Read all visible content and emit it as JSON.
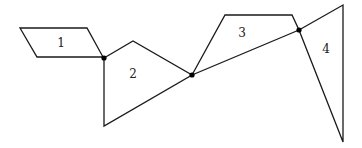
{
  "diagram": {
    "regions": [
      {
        "label": "1",
        "points": [
          [
            20,
            28
          ],
          [
            87,
            28
          ],
          [
            103,
            57
          ],
          [
            37,
            57
          ]
        ],
        "label_pos": [
          61,
          47
        ]
      },
      {
        "label": "2",
        "points": [
          [
            104,
            58
          ],
          [
            133,
            41
          ],
          [
            192,
            75
          ],
          [
            104,
            126
          ]
        ],
        "label_pos": [
          133,
          78
        ]
      },
      {
        "label": "3",
        "points": [
          [
            192,
            75
          ],
          [
            225,
            15
          ],
          [
            292,
            15
          ],
          [
            299,
            30
          ]
        ],
        "label_pos": [
          242,
          37
        ]
      },
      {
        "label": "4",
        "points": [
          [
            299,
            30
          ],
          [
            343,
            5
          ],
          [
            343,
            142
          ]
        ],
        "label_pos": [
          326,
          53
        ]
      }
    ],
    "vertices": [
      {
        "x": 104,
        "y": 58
      },
      {
        "x": 192,
        "y": 75
      },
      {
        "x": 299,
        "y": 30
      }
    ]
  }
}
